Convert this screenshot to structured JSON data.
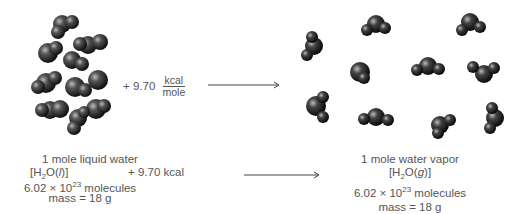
{
  "liquid": {
    "title": "1 mole liquid water",
    "formula_open": "[H",
    "formula_sub": "2",
    "formula_rest": "O(",
    "formula_state": "l",
    "formula_close": ")]",
    "energy": "+ 9.70 kcal",
    "molecules_prefix": "6.02 × 10",
    "molecules_exp": "23",
    "molecules_suffix": " molecules",
    "mass": "mass = 18 g"
  },
  "reaction": {
    "plus_value": "+ 9.70",
    "unit_num": "kcal",
    "unit_den": "mole"
  },
  "vapor": {
    "title": "1 mole water vapor",
    "formula_open": "[H",
    "formula_sub": "2",
    "formula_rest": "O(",
    "formula_state": "g",
    "formula_close": ")]",
    "molecules_prefix": "6.02 × 10",
    "molecules_exp": "23",
    "molecules_suffix": " molecules",
    "mass": "mass = 18 g"
  },
  "colors": {
    "molecule": "#2a2a2a",
    "text": "#555555",
    "arrow": "#444444"
  }
}
